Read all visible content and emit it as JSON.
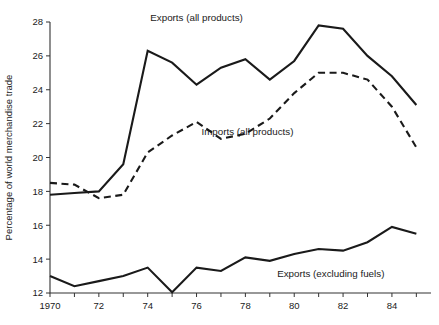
{
  "chart_data": {
    "type": "line",
    "title": "",
    "subtitle": "",
    "xlabel": "",
    "ylabel": "Percentage of world merchandise trade",
    "x": [
      1970,
      1971,
      1972,
      1973,
      1974,
      1975,
      1976,
      1977,
      1978,
      1979,
      1980,
      1981,
      1982,
      1983,
      1984,
      1985
    ],
    "xtick_labels": [
      "1970",
      "",
      "72",
      "",
      "74",
      "",
      "76",
      "",
      "78",
      "",
      "80",
      "",
      "82",
      "",
      "84",
      ""
    ],
    "xlim": [
      1970,
      1985.6
    ],
    "ylim": [
      12,
      28
    ],
    "yticks": [
      12,
      14,
      16,
      18,
      20,
      22,
      24,
      26,
      28
    ],
    "ytick_labels": [
      "12",
      "14",
      "16",
      "18",
      "20",
      "22",
      "24",
      "26",
      "28"
    ],
    "grid": false,
    "legend_position": "inline-annotations",
    "series": [
      {
        "name": "Exports (all products)",
        "style": "solid",
        "color": "#1a1a1a",
        "label_x": 1976.0,
        "label_y": 28.05,
        "values": [
          17.8,
          17.9,
          18.0,
          19.6,
          26.3,
          25.6,
          24.3,
          25.3,
          25.8,
          24.6,
          25.7,
          27.8,
          27.6,
          26.0,
          24.8,
          23.1
        ]
      },
      {
        "name": "Imports (all products)",
        "style": "dashed",
        "color": "#1a1a1a",
        "label_x": 1976.2,
        "label_y": 21.35,
        "values": [
          18.5,
          18.4,
          17.6,
          17.8,
          20.3,
          21.3,
          22.1,
          21.1,
          21.4,
          22.3,
          23.8,
          25.0,
          25.0,
          24.6,
          23.0,
          20.6
        ]
      },
      {
        "name": "Exports (excluding fuels)",
        "style": "solid",
        "color": "#1a1a1a",
        "label_x": 1979.3,
        "label_y": 12.95,
        "values": [
          13.0,
          12.4,
          12.7,
          13.0,
          13.5,
          12.05,
          13.5,
          13.3,
          14.1,
          13.9,
          14.3,
          14.6,
          14.5,
          15.0,
          15.9,
          15.5
        ]
      }
    ],
    "annotations": [
      {
        "text": "Exports (all products)",
        "name": "exports-all-products-label"
      },
      {
        "text": "Imports (all products)",
        "name": "imports-all-products-label"
      },
      {
        "text": "Exports (excluding fuels)",
        "name": "exports-excluding-fuels-label"
      }
    ]
  }
}
